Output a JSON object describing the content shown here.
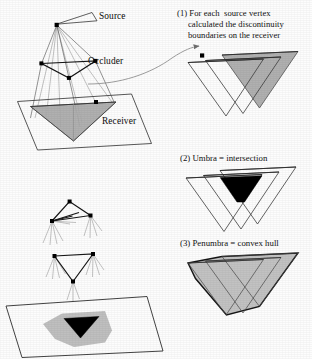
{
  "figure": {
    "background_color": "#fdfdfd",
    "ink_color": "#1a1a1a"
  },
  "scene_labels": {
    "source": "Source",
    "occluder": "Occluder",
    "receiver": "Receiver"
  },
  "steps": [
    {
      "id": "step-1",
      "number": "(1)",
      "caption_lines": [
        "(1) For each  source vertex",
        "calculated the discontinuity",
        "boundaries on the receiver"
      ],
      "full_caption": "(1) For each source vertex calculated the discontinuity boundaries on the receiver"
    },
    {
      "id": "step-2",
      "number": "(2)",
      "caption_lines": [
        "(2) Umbra = intersection"
      ],
      "full_caption": "(2) Umbra = intersection"
    },
    {
      "id": "step-3",
      "number": "(3)",
      "caption_lines": [
        "(3) Penumbra = convex hull"
      ],
      "full_caption": "(3) Penumbra = convex hull"
    }
  ],
  "colors": {
    "shadow_gray": "#a9a9a9",
    "penumbra_gray": "#bfbfbf",
    "umbra_black": "#000000",
    "outline": "#2b2b2b",
    "ray_gray": "#8f8f8f",
    "plane_outline": "#3a3a3a",
    "arrow_gray": "#7a7a7a"
  },
  "geometry": {
    "source_vertices": 3,
    "occluder_vertices": 3,
    "projected_triangles": 3,
    "umbra_shape": "triangle-intersection",
    "penumbra_shape": "convex-hull-trapezoid"
  }
}
